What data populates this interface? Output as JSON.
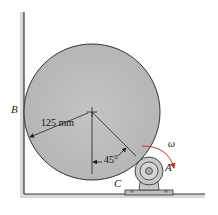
{
  "figure": {
    "labels": {
      "B": "B",
      "A": "A",
      "C": "C",
      "omega": "ω"
    },
    "dimensions": {
      "radius": "125 mm",
      "angle": "45°"
    },
    "colors": {
      "disk_fill": "#bdbdbd",
      "disk_stroke": "#333333",
      "wall": "#444444",
      "roller": "#c8c8c8",
      "arrow": "#c0392b"
    }
  }
}
